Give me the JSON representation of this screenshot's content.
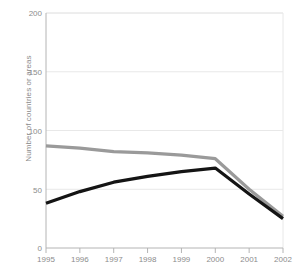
{
  "chart_data": {
    "type": "line",
    "title": "",
    "xlabel": "",
    "ylabel": "Number of countries or areas",
    "x": [
      1995,
      1996,
      1997,
      1998,
      1999,
      2000,
      2001,
      2002
    ],
    "xtick_labels": [
      "1995",
      "1996",
      "1997",
      "1998",
      "1999",
      "2000",
      "2001",
      "2002"
    ],
    "ytick_labels": [
      "0",
      "50",
      "100",
      "150",
      "200"
    ],
    "yticks": [
      0,
      50,
      100,
      150,
      200
    ],
    "ylim": [
      0,
      200
    ],
    "xlim": [
      1995,
      2002
    ],
    "grid": true,
    "legend": "none",
    "series": [
      {
        "name": "gray-series",
        "color": "#9a9a9a",
        "values": [
          87,
          85,
          82,
          81,
          79,
          76,
          50,
          27
        ]
      },
      {
        "name": "black-series",
        "color": "#141414",
        "values": [
          38,
          48,
          56,
          61,
          65,
          68,
          46,
          25
        ]
      }
    ]
  },
  "style": {
    "axis_color": "#b4b4b4",
    "grid_color": "#e8e8e8",
    "tick_text_color": "#8c8c8c",
    "background": "#ffffff"
  }
}
